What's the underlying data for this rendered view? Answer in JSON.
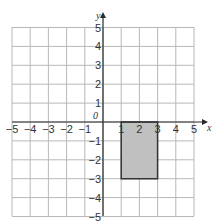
{
  "diagram": {
    "type": "coordinate-grid",
    "x_axis": {
      "label": "x",
      "min": -5,
      "max": 5,
      "ticks": [
        "-5",
        "-4",
        "-3",
        "-2",
        "-1",
        "1",
        "2",
        "3",
        "4",
        "5"
      ]
    },
    "y_axis": {
      "label": "y",
      "min": -5,
      "max": 5,
      "ticks": [
        "5",
        "4",
        "3",
        "2",
        "1",
        "-1",
        "-2",
        "-3",
        "-4",
        "-5"
      ]
    },
    "origin_label": "0",
    "shape": {
      "type": "rectangle",
      "vertices": [
        [
          1,
          0
        ],
        [
          3,
          0
        ],
        [
          3,
          -3
        ],
        [
          1,
          -3
        ]
      ],
      "fill": "#c0c0c0",
      "stroke": "#333333"
    },
    "colors": {
      "grid": "#b8b8b8",
      "axis": "#2a2a2a",
      "text": "#333333"
    }
  }
}
